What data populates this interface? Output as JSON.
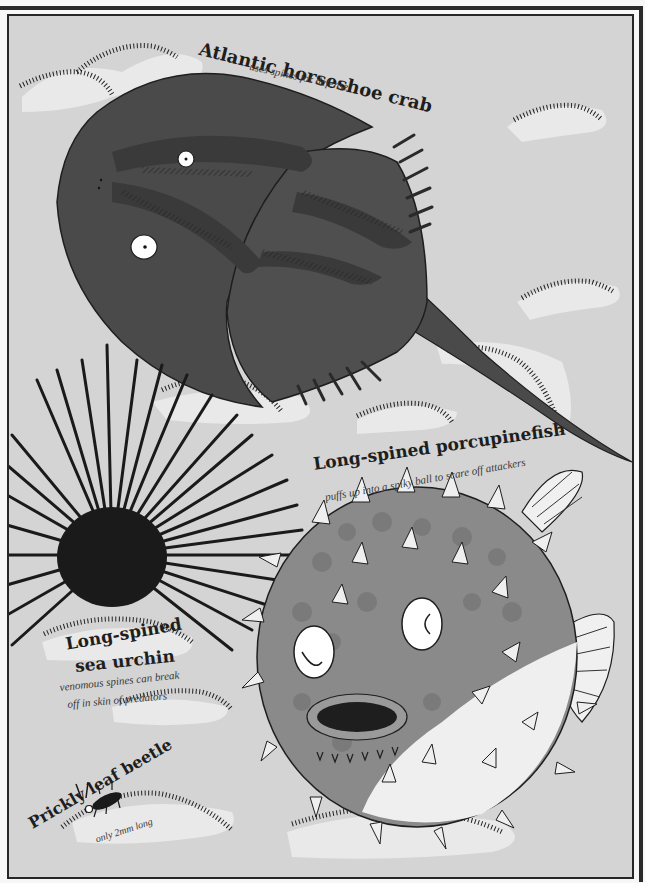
{
  "illustration": {
    "palette": {
      "background": "#d4d4d4",
      "frame": "#262626",
      "page": "#f7f7f7",
      "crab_body": "#4a4a4a",
      "crab_shade": "#3a3a3a",
      "fish_body": "#8a8a8a",
      "fish_spots": "#7a7a7a",
      "fish_belly": "#efefef",
      "urchin": "#1a1a1a",
      "seaweed_glow": "#e9e9e9"
    },
    "creatures": [
      {
        "name": "Atlantic horseshoe crab",
        "caption": "uses spines for defense"
      },
      {
        "name": "Long-spined porcupinefish",
        "caption": "puffs up into a spiky ball to scare off attackers"
      },
      {
        "name_line1": "Long-spined",
        "name_line2": "sea urchin",
        "caption_line1": "venomous spines can break",
        "caption_line2": "off in skin of predators"
      },
      {
        "name": "Prickly leaf beetle",
        "caption": "only 2mm long"
      }
    ]
  }
}
